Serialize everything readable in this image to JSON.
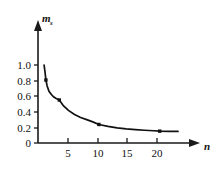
{
  "chart_data": {
    "type": "line",
    "title": "",
    "xlabel": "n",
    "ylabel": "m_s",
    "ylabel_base": "m",
    "ylabel_sub": "s",
    "xlim": [
      0,
      23
    ],
    "ylim": [
      0,
      1.12
    ],
    "grid": false,
    "legend": null,
    "x_ticks": [
      5,
      10,
      15,
      20
    ],
    "x_tick_labels": [
      "5",
      "10",
      "15",
      "20"
    ],
    "y_ticks": [
      0,
      0.2,
      0.4,
      0.6,
      0.8,
      1.0
    ],
    "y_tick_labels": [
      "0",
      "0.2",
      "0.4",
      "0.6",
      "0.8",
      "1.0"
    ],
    "series": [
      {
        "name": "m_s vs n",
        "marker": "square",
        "x": [
          1.3,
          3.5,
          10.0,
          20.0
        ],
        "y": [
          0.85,
          0.58,
          0.25,
          0.16
        ]
      }
    ],
    "curve": {
      "x": [
        1.0,
        1.15,
        1.3,
        1.5,
        1.8,
        2.2,
        2.6,
        3.0,
        3.5,
        4.2,
        5.0,
        6.0,
        7.0,
        8.0,
        9.0,
        10.0,
        11.5,
        13.0,
        14.5,
        16.0,
        17.5,
        19.0,
        20.0,
        21.5,
        23.0
      ],
      "y": [
        1.05,
        0.96,
        0.85,
        0.77,
        0.7,
        0.655,
        0.62,
        0.6,
        0.58,
        0.5,
        0.44,
        0.385,
        0.345,
        0.315,
        0.285,
        0.25,
        0.225,
        0.205,
        0.19,
        0.18,
        0.172,
        0.165,
        0.16,
        0.158,
        0.157
      ]
    },
    "colors": {
      "axis": "#1a1a1a",
      "curve": "#111111",
      "marker": "#111111",
      "background": "#ffffff"
    }
  }
}
